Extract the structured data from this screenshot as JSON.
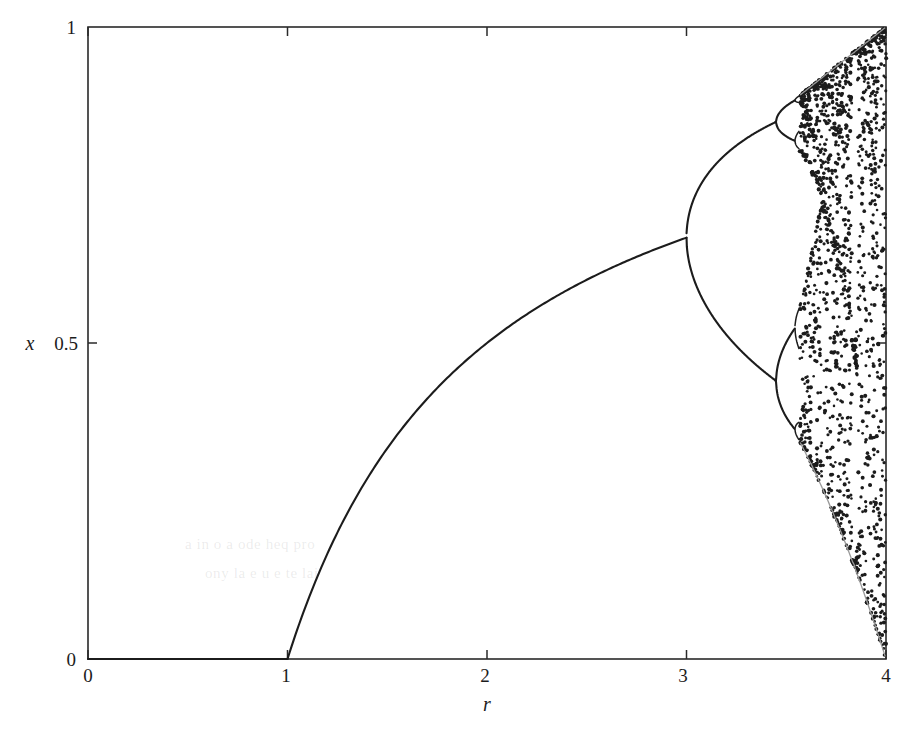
{
  "figure": {
    "kind": "bifurcation-diagram",
    "background_color": "#ffffff",
    "ink_color": "#1c1c1c"
  },
  "axes": {
    "x_label": "r",
    "y_label": "x",
    "x_ticks": [
      "0",
      "1",
      "2",
      "3",
      "4"
    ],
    "x_tick_values": [
      0,
      1,
      2,
      3,
      4
    ],
    "y_ticks": [
      "0",
      "0.5",
      "1"
    ],
    "y_tick_values": [
      0,
      0.5,
      1
    ],
    "frame": {
      "left": 88,
      "right": 886,
      "top": 27,
      "bottom": 659
    }
  },
  "chart_data": {
    "type": "scatter",
    "title": "",
    "xlabel": "r",
    "ylabel": "x",
    "xlim": [
      0,
      4
    ],
    "ylim": [
      0,
      1
    ],
    "grid": false,
    "legend": null,
    "regions": [
      {
        "name": "extinction-fixed-point",
        "r_range": [
          0,
          1
        ],
        "x_values": [
          0
        ],
        "note": "Stable fixed point at x = 0 for 0 <= r <= 1"
      },
      {
        "name": "nonzero-fixed-point",
        "r_range": [
          1,
          3
        ],
        "formula": "x = 1 - 1/r",
        "endpoints": [
          [
            1,
            0
          ],
          [
            3,
            0.6667
          ]
        ],
        "note": "Single stable fixed point rising from 0 at r = 1 to 2/3 at r = 3"
      },
      {
        "name": "period-2",
        "r_range": [
          3,
          3.449
        ],
        "note": "Two branches after first period-doubling at r = 3",
        "endpoints_upper": [
          [
            3,
            0.6667
          ],
          [
            3.449,
            0.8499
          ]
        ],
        "endpoints_lower": [
          [
            3,
            0.6667
          ],
          [
            3.449,
            0.4399
          ]
        ]
      },
      {
        "name": "period-4",
        "r_range": [
          3.449,
          3.544
        ],
        "note": "Four branches after second period-doubling at r = 3.449"
      },
      {
        "name": "chaos",
        "r_range": [
          3.5699,
          4.0
        ],
        "note": "Chaotic band; attractor fills interval bounded above by r/4 and below by the second iterate of the critical point",
        "upper_bound_at_r4": 1.0,
        "lower_bound_at_r4": 0.0
      }
    ],
    "bifurcation_points": [
      {
        "label": "period-1 onset",
        "r": 1.0,
        "x": 0.0
      },
      {
        "label": "period-2 onset",
        "r": 3.0,
        "x": 0.6667
      },
      {
        "label": "period-4 onset",
        "r": 3.449,
        "x_upper": 0.8499,
        "x_lower": 0.4399
      },
      {
        "label": "period-8 onset",
        "r": 3.544
      },
      {
        "label": "chaos onset",
        "r": 3.5699
      }
    ]
  },
  "artifacts": {
    "ghost_text_note": "faint show-through text from reverse of scanned page",
    "ghost_lines": [
      "a  in  o  a   ode heq pro",
      "ony  la  e u  e    te  lai"
    ]
  }
}
